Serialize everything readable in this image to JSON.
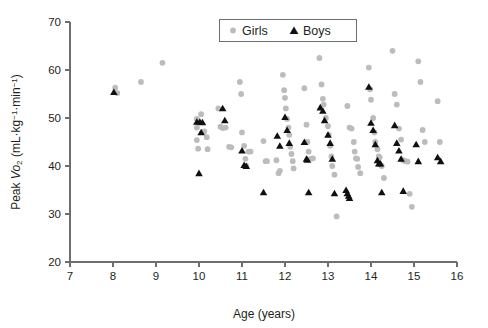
{
  "chart_data": {
    "type": "scatter",
    "title": "",
    "xlabel": "Age (years)",
    "ylabel": "Peak Vo2 (mL·kg-1·min-1)",
    "ylabel_parts": {
      "lead": "Peak ",
      "v": "V",
      "o": "o",
      "sub2": "2",
      "unit_open": " (mL·kg",
      "sup1": "−1",
      "mid": "·min",
      "sup2": "−1",
      "unit_close": ")"
    },
    "xlim": [
      7,
      16
    ],
    "ylim": [
      20,
      70
    ],
    "xticks": [
      7,
      8,
      9,
      10,
      11,
      12,
      13,
      14,
      15,
      16
    ],
    "yticks": [
      20,
      30,
      40,
      50,
      60,
      70
    ],
    "grid": false,
    "legend_position": "top-center",
    "colors": {
      "girls": "#bcbcbc",
      "boys": "#101010",
      "axis": "#6d6e70",
      "text": "#231f20",
      "background": "#ffffff"
    },
    "legend": [
      {
        "name": "Girls",
        "marker": "circle",
        "color": "#bcbcbc"
      },
      {
        "name": "Boys",
        "marker": "triangle",
        "color": "#101010"
      }
    ],
    "series": [
      {
        "name": "Girls",
        "marker": "circle",
        "color": "#bcbcbc",
        "points": [
          [
            8.05,
            56.3
          ],
          [
            8.1,
            55.2
          ],
          [
            8.65,
            57.5
          ],
          [
            9.15,
            61.5
          ],
          [
            9.95,
            49.8
          ],
          [
            9.95,
            48.0
          ],
          [
            9.95,
            45.4
          ],
          [
            9.98,
            43.6
          ],
          [
            10.05,
            50.8
          ],
          [
            10.12,
            47.2
          ],
          [
            10.18,
            46.0
          ],
          [
            10.2,
            43.5
          ],
          [
            10.45,
            52.0
          ],
          [
            10.5,
            48.2
          ],
          [
            10.55,
            47.9
          ],
          [
            10.62,
            48.0
          ],
          [
            10.7,
            44.0
          ],
          [
            10.75,
            43.9
          ],
          [
            10.95,
            57.5
          ],
          [
            10.98,
            55.0
          ],
          [
            11.0,
            47.0
          ],
          [
            11.05,
            44.2
          ],
          [
            11.08,
            41.5
          ],
          [
            11.1,
            40.0
          ],
          [
            11.15,
            43.0
          ],
          [
            11.2,
            43.0
          ],
          [
            11.5,
            45.2
          ],
          [
            11.55,
            41.0
          ],
          [
            11.58,
            41.0
          ],
          [
            11.8,
            41.2
          ],
          [
            11.85,
            38.5
          ],
          [
            11.88,
            39.0
          ],
          [
            11.95,
            59.0
          ],
          [
            11.98,
            55.8
          ],
          [
            12.0,
            54.2
          ],
          [
            12.02,
            52.0
          ],
          [
            12.05,
            49.8
          ],
          [
            12.08,
            48.0
          ],
          [
            12.1,
            46.5
          ],
          [
            12.12,
            44.0
          ],
          [
            12.15,
            42.5
          ],
          [
            12.18,
            41.0
          ],
          [
            12.2,
            39.5
          ],
          [
            12.45,
            56.2
          ],
          [
            12.5,
            48.6
          ],
          [
            12.52,
            45.0
          ],
          [
            12.55,
            43.0
          ],
          [
            12.6,
            41.5
          ],
          [
            12.65,
            41.6
          ],
          [
            12.8,
            62.5
          ],
          [
            12.85,
            57.0
          ],
          [
            12.88,
            54.0
          ],
          [
            12.9,
            52.8
          ],
          [
            12.95,
            50.0
          ],
          [
            13.0,
            48.3
          ],
          [
            13.02,
            46.5
          ],
          [
            13.05,
            44.2
          ],
          [
            13.08,
            42.0
          ],
          [
            13.1,
            40.0
          ],
          [
            13.15,
            38.2
          ],
          [
            13.2,
            29.5
          ],
          [
            13.45,
            52.5
          ],
          [
            13.5,
            48.0
          ],
          [
            13.55,
            47.8
          ],
          [
            13.6,
            45.0
          ],
          [
            13.62,
            43.0
          ],
          [
            13.65,
            41.6
          ],
          [
            13.68,
            41.5
          ],
          [
            13.7,
            39.8
          ],
          [
            13.75,
            38.5
          ],
          [
            13.95,
            60.5
          ],
          [
            13.98,
            56.0
          ],
          [
            14.0,
            53.8
          ],
          [
            14.05,
            50.0
          ],
          [
            14.08,
            47.0
          ],
          [
            14.1,
            45.0
          ],
          [
            14.15,
            43.5
          ],
          [
            14.18,
            42.0
          ],
          [
            14.2,
            41.8
          ],
          [
            14.25,
            40.0
          ],
          [
            14.3,
            37.5
          ],
          [
            14.5,
            64.0
          ],
          [
            14.55,
            55.0
          ],
          [
            14.6,
            52.8
          ],
          [
            14.65,
            47.8
          ],
          [
            14.7,
            45.5
          ],
          [
            14.75,
            41.2
          ],
          [
            14.8,
            41.0
          ],
          [
            14.85,
            40.9
          ],
          [
            14.9,
            34.2
          ],
          [
            14.95,
            31.5
          ],
          [
            15.1,
            61.8
          ],
          [
            15.15,
            57.5
          ],
          [
            15.2,
            47.5
          ],
          [
            15.25,
            45.0
          ],
          [
            15.55,
            53.5
          ],
          [
            15.6,
            45.0
          ]
        ]
      },
      {
        "name": "Boys",
        "marker": "triangle",
        "color": "#101010",
        "points": [
          [
            8.02,
            55.4
          ],
          [
            9.95,
            49.2
          ],
          [
            10.02,
            49.2
          ],
          [
            10.08,
            49.1
          ],
          [
            10.05,
            47.0
          ],
          [
            10.0,
            38.5
          ],
          [
            10.55,
            52.0
          ],
          [
            10.6,
            49.5
          ],
          [
            11.0,
            43.2
          ],
          [
            11.05,
            40.2
          ],
          [
            11.1,
            40.0
          ],
          [
            11.5,
            34.5
          ],
          [
            11.82,
            46.3
          ],
          [
            11.88,
            44.2
          ],
          [
            12.0,
            50.2
          ],
          [
            12.05,
            47.5
          ],
          [
            12.1,
            44.8
          ],
          [
            12.45,
            45.0
          ],
          [
            12.5,
            41.5
          ],
          [
            12.52,
            41.3
          ],
          [
            12.55,
            34.5
          ],
          [
            12.82,
            52.2
          ],
          [
            12.88,
            51.5
          ],
          [
            12.92,
            49.5
          ],
          [
            13.0,
            46.5
          ],
          [
            13.05,
            44.8
          ],
          [
            13.1,
            41.5
          ],
          [
            13.15,
            34.3
          ],
          [
            13.42,
            35.0
          ],
          [
            13.45,
            34.3
          ],
          [
            13.48,
            33.8
          ],
          [
            13.5,
            33.3
          ],
          [
            13.95,
            56.5
          ],
          [
            14.0,
            49.0
          ],
          [
            14.05,
            47.5
          ],
          [
            14.1,
            44.5
          ],
          [
            14.15,
            41.2
          ],
          [
            14.18,
            40.5
          ],
          [
            14.22,
            40.5
          ],
          [
            14.25,
            34.5
          ],
          [
            14.55,
            48.5
          ],
          [
            14.6,
            44.8
          ],
          [
            14.65,
            43.2
          ],
          [
            14.7,
            41.5
          ],
          [
            14.75,
            34.8
          ],
          [
            15.05,
            44.5
          ],
          [
            15.1,
            41.0
          ],
          [
            15.55,
            41.8
          ],
          [
            15.62,
            41.0
          ]
        ]
      }
    ]
  },
  "axis": {
    "x_tick_labels": [
      "7",
      "8",
      "9",
      "10",
      "11",
      "12",
      "13",
      "14",
      "15",
      "16"
    ],
    "y_tick_labels": [
      "20",
      "30",
      "40",
      "50",
      "60",
      "70"
    ],
    "x_title": "Age (years)"
  },
  "legend": {
    "girls_label": "Girls",
    "boys_label": "Boys"
  }
}
